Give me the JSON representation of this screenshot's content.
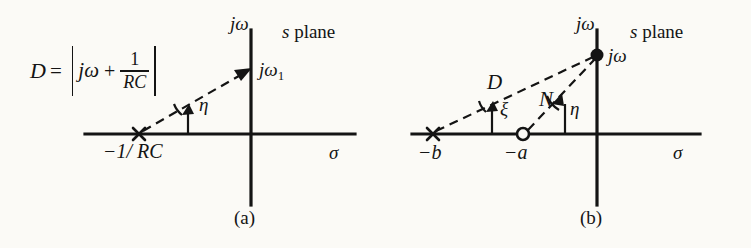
{
  "figure": {
    "background_color": "#fbfaf6",
    "ink_color": "#141414",
    "panels": [
      {
        "id": "a",
        "caption": "(a)",
        "plane_label": "s plane",
        "plane_label_italic_part": "s",
        "plane_label_roman_part": " plane",
        "imaginary_axis_label": "jω",
        "real_axis_label": "σ",
        "equation": {
          "lhs": "D",
          "equals": "=",
          "magnitude_open": "|",
          "magnitude_close": "|",
          "first_term": "jω",
          "operator": "+",
          "fraction_numerator": "1",
          "fraction_denominator": "RC"
        },
        "markers": [
          {
            "name": "pole-at-minus-one-over-rc",
            "glyph": "×",
            "label": "−1/ RC",
            "type": "pole"
          }
        ],
        "vectors": [
          {
            "name": "vector-to-j-omega-1",
            "style": "dashed-arrow",
            "tip_label": "jω",
            "tip_label_subscript": "1"
          }
        ],
        "angles": [
          {
            "name": "angle-eta",
            "label": "η"
          }
        ]
      },
      {
        "id": "b",
        "caption": "(b)",
        "plane_label": "s plane",
        "plane_label_italic_part": "s",
        "plane_label_roman_part": " plane",
        "imaginary_axis_label": "jω",
        "real_axis_label": "σ",
        "point_label": "jω",
        "markers": [
          {
            "name": "pole-at-minus-b",
            "glyph": "×",
            "label": "−b",
            "type": "pole"
          },
          {
            "name": "zero-at-minus-a",
            "glyph": "○",
            "label": "−a",
            "type": "zero"
          }
        ],
        "vectors": [
          {
            "name": "vector-D-from-pole",
            "style": "dashed",
            "label": "D"
          },
          {
            "name": "vector-N-from-zero",
            "style": "dashed",
            "label": "N"
          }
        ],
        "angles": [
          {
            "name": "angle-xi",
            "label": "ξ"
          },
          {
            "name": "angle-eta",
            "label": "η"
          }
        ]
      }
    ]
  }
}
